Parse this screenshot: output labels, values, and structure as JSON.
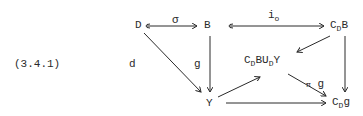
{
  "equation_number": "(3.4.1)",
  "nodes": {
    "D": {
      "text": "D"
    },
    "B": {
      "text": "B"
    },
    "CDB": {
      "main": "C",
      "sub": "D",
      "tail": "B"
    },
    "pushout": {
      "c": "C",
      "sub1": "D",
      "b": "B",
      "u": "U",
      "sub2": "D",
      "y": "Y"
    },
    "Y": {
      "text": "Y"
    },
    "CDg": {
      "main": "C",
      "sub": "D",
      "tail": "g"
    }
  },
  "arrow_labels": {
    "sigma": "σ",
    "i0_main": "i",
    "i0_sub": "o",
    "d": "d",
    "g": "g",
    "pi_g_pi": "π",
    "pi_g_g": "g"
  },
  "edges": [
    {
      "from": "D",
      "to": "B",
      "label": "σ",
      "style": "hook"
    },
    {
      "from": "B",
      "to": "CDB",
      "label": "i_o",
      "style": "hook"
    },
    {
      "from": "D",
      "to": "Y",
      "label": "d"
    },
    {
      "from": "B",
      "to": "Y",
      "label": "g"
    },
    {
      "from": "CDB",
      "to": "pushout"
    },
    {
      "from": "CDB",
      "to": "CDg"
    },
    {
      "from": "Y",
      "to": "pushout"
    },
    {
      "from": "pushout",
      "to": "CDg",
      "label": "π g"
    },
    {
      "from": "Y",
      "to": "CDg"
    }
  ]
}
